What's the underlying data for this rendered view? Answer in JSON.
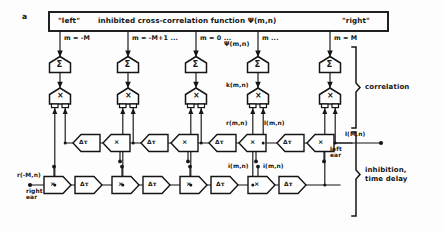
{
  "figure": {
    "panel_label": "a",
    "title_bar": {
      "left_tag": "\"left\"",
      "title": "inhibited cross-correlation function  Ψ(m,n)",
      "right_tag": "\"right\""
    },
    "output_label": "Ψ(m,n)",
    "columns": [
      {
        "index_label": "m = -M",
        "sum": "Σ",
        "mult": "×"
      },
      {
        "index_label": "m = -M+1 ...",
        "sum": "Σ",
        "mult": "×"
      },
      {
        "index_label": "m = 0 ...",
        "sum": "Σ",
        "mult": "×"
      },
      {
        "index_label": "m ...",
        "sum": "Σ",
        "mult": "×"
      },
      {
        "index_label": "m = M",
        "sum": "Σ",
        "mult": "×"
      }
    ],
    "node_glyphs": {
      "sum": "Σ",
      "multiply": "×",
      "delay": "Δτ"
    },
    "signal_labels": {
      "k_mn": "k(m,n)",
      "r_mn": "r(m,n)",
      "l_mn_upper": "l(m,n)",
      "i_mn_left": "i(m,n)",
      "i_mn_right": "i(m,n)",
      "l_Mn": "l(M,n)",
      "r_minusM_n": "r(-M,n)"
    },
    "ear_labels": {
      "left": "left\near",
      "right": "right\near"
    },
    "braces": [
      {
        "name": "correlation",
        "text": "correlation"
      },
      {
        "name": "inhibition-time-delay",
        "text": "inhibition,\ntime delay"
      }
    ],
    "upper_chain": [
      {
        "type": "delay",
        "glyph": "Δτ"
      },
      {
        "type": "multiply",
        "glyph": "×"
      },
      {
        "type": "delay",
        "glyph": "Δτ"
      },
      {
        "type": "multiply",
        "glyph": "×"
      },
      {
        "type": "delay",
        "glyph": "Δτ"
      },
      {
        "type": "multiply",
        "glyph": "×"
      },
      {
        "type": "delay",
        "glyph": "Δτ"
      },
      {
        "type": "multiply",
        "glyph": "×"
      }
    ],
    "lower_chain": [
      {
        "type": "multiply",
        "glyph": "×"
      },
      {
        "type": "delay",
        "glyph": "Δτ"
      },
      {
        "type": "multiply",
        "glyph": "×"
      },
      {
        "type": "delay",
        "glyph": "Δτ"
      },
      {
        "type": "multiply",
        "glyph": "×"
      },
      {
        "type": "delay",
        "glyph": "Δτ"
      },
      {
        "type": "multiply",
        "glyph": "×"
      },
      {
        "type": "delay",
        "glyph": "Δτ"
      }
    ],
    "colors": {
      "ink": "#151515",
      "paper": "#fdfdfd"
    }
  }
}
